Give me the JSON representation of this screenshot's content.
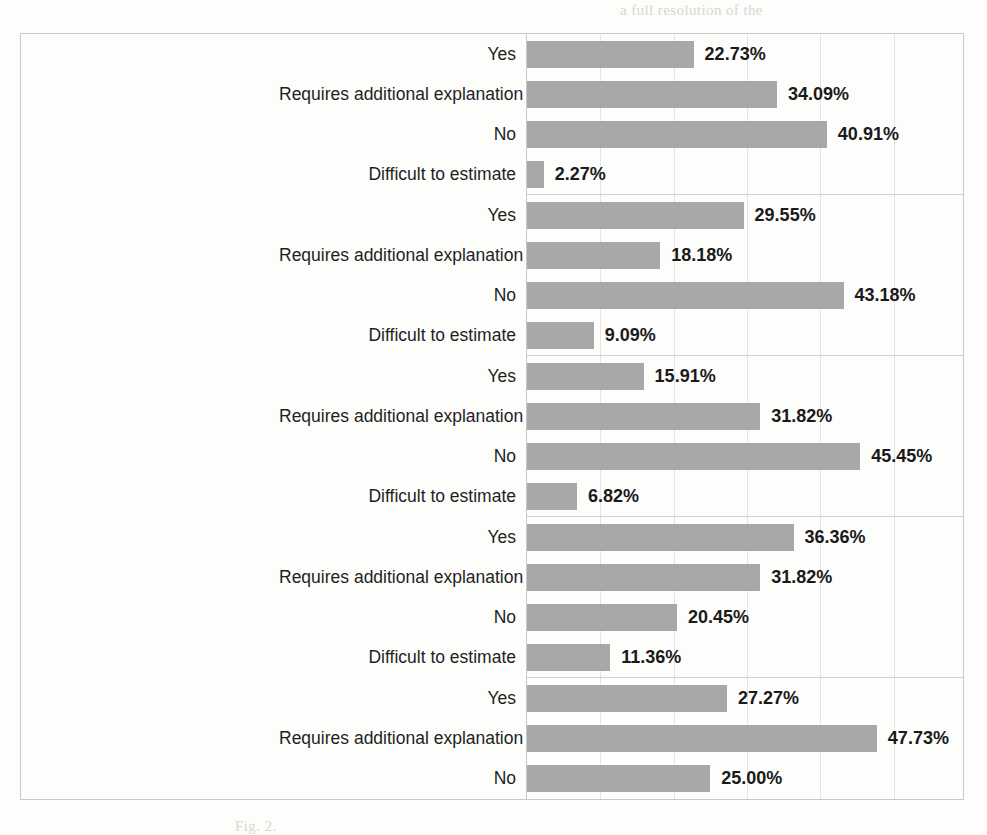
{
  "chart_data": {
    "type": "bar",
    "orientation": "horizontal",
    "title": "",
    "xlabel": "",
    "ylabel": "",
    "xlim": [
      0,
      55
    ],
    "grid": true,
    "grid_interval": 10,
    "legend": "none",
    "bar_color": "#a8a8a8",
    "value_format": "percent",
    "groups": [
      {
        "question": "Is readiness business processes for transformation high?",
        "question_columns": [
          "Is readiness",
          "business",
          "processes for",
          "transformation",
          "high?"
        ],
        "categories": [
          "Yes",
          "Requires additional explanation",
          "No",
          "Difficult to estimate"
        ],
        "values": [
          22.73,
          34.09,
          40.91,
          2.27
        ],
        "labels": [
          "22.73%",
          "34.09%",
          "40.91%",
          "2.27%"
        ]
      },
      {
        "question": "Is personnel readiness for transformation is high?",
        "question_columns": [
          "Is personnel",
          "readiness for",
          "transformation",
          "is high?"
        ],
        "categories": [
          "Yes",
          "Requires additional explanation",
          "No",
          "Difficult to estimate"
        ],
        "values": [
          29.55,
          18.18,
          43.18,
          9.09
        ],
        "labels": [
          "29.55%",
          "18.18%",
          "43.18%",
          "9.09%"
        ]
      },
      {
        "question": "Is maturity of data management high?",
        "question_columns": [
          "Is maturity of",
          "data",
          "management",
          "high?"
        ],
        "categories": [
          "Yes",
          "Requires additional explanation",
          "No",
          "Difficult to estimate"
        ],
        "values": [
          15.91,
          31.82,
          45.45,
          6.82
        ],
        "labels": [
          "15.91%",
          "31.82%",
          "45.45%",
          "6.82%"
        ]
      },
      {
        "question": "Is management in your company systematic?",
        "question_columns": [
          "Is management",
          "in your",
          "company",
          "systematic?"
        ],
        "categories": [
          "Yes",
          "Requires additional explanation",
          "No",
          "Difficult to estimate"
        ],
        "values": [
          36.36,
          31.82,
          20.45,
          11.36
        ],
        "labels": [
          "36.36%",
          "31.82%",
          "20.45%",
          "11.36%"
        ]
      },
      {
        "question": "Does your company use an architectural approach?",
        "question_columns": [
          "Does your",
          "company",
          "use an",
          "architectura",
          "l approach?"
        ],
        "categories": [
          "Yes",
          "Requires additional explanation",
          "No"
        ],
        "values": [
          27.27,
          47.73,
          25.0
        ],
        "labels": [
          "27.27%",
          "47.73%",
          "25.00%"
        ]
      }
    ]
  },
  "bleed_text": [
    {
      "text": "a full resolution of the",
      "x": 620,
      "y": 2
    },
    {
      "text": "in a lot of think of think of think",
      "x": 250,
      "y": 66
    },
    {
      "text": "is not yet to the before from the",
      "x": 250,
      "y": 118
    },
    {
      "text": "approach. This is a method of research",
      "x": 250,
      "y": 165
    },
    {
      "text": "and the level of the existing process",
      "x": 250,
      "y": 200
    },
    {
      "text": "of the architecture",
      "x": 130,
      "y": 256
    },
    {
      "text": "in the context of the applying",
      "x": 250,
      "y": 300
    },
    {
      "text": "variable to the level and the concepts",
      "x": 160,
      "y": 330
    },
    {
      "text": "of the consideration of the maturity",
      "x": 200,
      "y": 360
    },
    {
      "text": "of the stages and level of the",
      "x": 160,
      "y": 400
    },
    {
      "text": "the new approach to the research",
      "x": 200,
      "y": 430
    },
    {
      "text": "are that have been of the study",
      "x": 160,
      "y": 462
    },
    {
      "text": "Fig. 2.",
      "x": 235,
      "y": 818
    }
  ]
}
